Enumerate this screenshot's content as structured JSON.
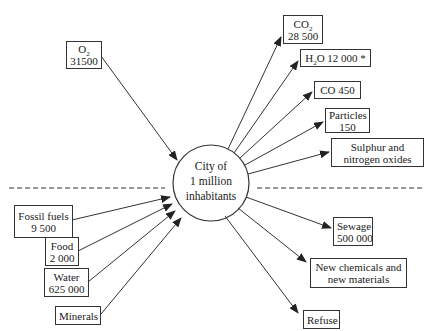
{
  "diagram": {
    "title": "City of 1 million inhabitants",
    "center": {
      "line1": "City of",
      "line2": "1 million",
      "line3": "inhabitants"
    },
    "inputs": [
      {
        "id": "o2",
        "label": "O2",
        "label_base": "O",
        "label_sub": "2",
        "value": "31500"
      },
      {
        "id": "fossil",
        "label": "Fossil fuels",
        "value": "9 500"
      },
      {
        "id": "food",
        "label": "Food",
        "value": "2 000"
      },
      {
        "id": "water",
        "label": "Water",
        "value": "625 000"
      },
      {
        "id": "minerals",
        "label": "Minerals",
        "value": ""
      }
    ],
    "outputs": [
      {
        "id": "co2",
        "label": "CO2",
        "label_base": "CO",
        "label_sub": "2",
        "value": "28 500"
      },
      {
        "id": "h2o",
        "label": "H2O 12 000 *",
        "label_base": "H",
        "label_sub": "2",
        "label_rest": "O 12 000 *"
      },
      {
        "id": "co",
        "label": "CO 450"
      },
      {
        "id": "particles",
        "label": "Particles",
        "value": "150"
      },
      {
        "id": "sulphur",
        "label": "Sulphur and",
        "label2": "nitrogen oxides"
      },
      {
        "id": "sewage",
        "label": "Sewage",
        "value": "500 000"
      },
      {
        "id": "chemicals",
        "label": "New chemicals and",
        "label2": "new materials"
      },
      {
        "id": "refuse",
        "label": "Refuse"
      }
    ],
    "divider": "dashed horizontal line separating atmospheric (above) from land-based (below) flows"
  }
}
